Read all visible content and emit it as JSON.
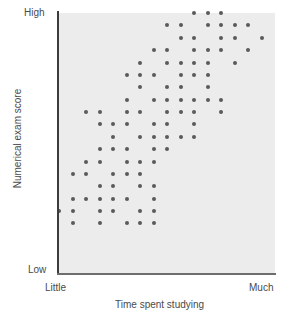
{
  "chart_data": {
    "type": "scatter",
    "title": "",
    "xlabel": "Time spent studying",
    "ylabel": "Numerical exam score",
    "x_tick_labels": [
      "Little",
      "Much"
    ],
    "y_tick_labels": [
      "Low",
      "High"
    ],
    "xlim": [
      0,
      16
    ],
    "ylim": [
      0,
      21
    ],
    "grid": false,
    "legend": null,
    "marker_color": "#5a5a5a",
    "plot_background": "#ececec",
    "axis_color": "#3c3c3c",
    "points": [
      [
        10,
        21
      ],
      [
        11,
        21
      ],
      [
        12,
        21
      ],
      [
        8,
        20
      ],
      [
        9,
        20
      ],
      [
        11,
        20
      ],
      [
        12,
        20
      ],
      [
        13,
        20
      ],
      [
        14,
        20
      ],
      [
        9,
        19
      ],
      [
        10,
        19
      ],
      [
        12,
        19
      ],
      [
        13,
        19
      ],
      [
        15,
        19
      ],
      [
        7,
        18
      ],
      [
        8,
        18
      ],
      [
        10,
        18
      ],
      [
        11,
        18
      ],
      [
        12,
        18
      ],
      [
        14,
        18
      ],
      [
        6,
        17
      ],
      [
        8,
        17
      ],
      [
        9,
        17
      ],
      [
        10,
        17
      ],
      [
        11,
        17
      ],
      [
        13,
        17
      ],
      [
        5,
        16
      ],
      [
        6,
        16
      ],
      [
        7,
        16
      ],
      [
        9,
        16
      ],
      [
        10,
        16
      ],
      [
        11,
        16
      ],
      [
        6,
        15
      ],
      [
        8,
        15
      ],
      [
        9,
        15
      ],
      [
        11,
        15
      ],
      [
        5,
        14
      ],
      [
        7,
        14
      ],
      [
        8,
        14
      ],
      [
        9,
        14
      ],
      [
        10,
        14
      ],
      [
        11,
        14
      ],
      [
        12,
        14
      ],
      [
        2,
        13
      ],
      [
        3,
        13
      ],
      [
        5,
        13
      ],
      [
        6,
        13
      ],
      [
        8,
        13
      ],
      [
        9,
        13
      ],
      [
        10,
        13
      ],
      [
        12,
        13
      ],
      [
        3,
        12
      ],
      [
        4,
        12
      ],
      [
        5,
        12
      ],
      [
        7,
        12
      ],
      [
        8,
        12
      ],
      [
        10,
        12
      ],
      [
        4,
        11
      ],
      [
        6,
        11
      ],
      [
        7,
        11
      ],
      [
        8,
        11
      ],
      [
        9,
        11
      ],
      [
        10,
        11
      ],
      [
        3,
        10
      ],
      [
        4,
        10
      ],
      [
        5,
        10
      ],
      [
        7,
        10
      ],
      [
        8,
        10
      ],
      [
        2,
        9
      ],
      [
        3,
        9
      ],
      [
        5,
        9
      ],
      [
        6,
        9
      ],
      [
        7,
        9
      ],
      [
        1,
        8
      ],
      [
        2,
        8
      ],
      [
        4,
        8
      ],
      [
        5,
        8
      ],
      [
        6,
        8
      ],
      [
        3,
        7
      ],
      [
        4,
        7
      ],
      [
        6,
        7
      ],
      [
        7,
        7
      ],
      [
        1,
        6
      ],
      [
        2,
        6
      ],
      [
        3,
        6
      ],
      [
        4,
        6
      ],
      [
        5,
        6
      ],
      [
        7,
        6
      ],
      [
        0,
        5
      ],
      [
        1,
        5
      ],
      [
        3,
        5
      ],
      [
        4,
        5
      ],
      [
        6,
        5
      ],
      [
        7,
        5
      ],
      [
        1,
        4
      ],
      [
        3,
        4
      ],
      [
        5,
        4
      ],
      [
        6,
        4
      ],
      [
        7,
        4
      ]
    ]
  },
  "chart": {
    "labels": {
      "y_high": "High",
      "y_low": "Low",
      "x_little": "Little",
      "x_much": "Much",
      "x_title": "Time spent studying",
      "y_title": "Numerical exam score"
    }
  }
}
